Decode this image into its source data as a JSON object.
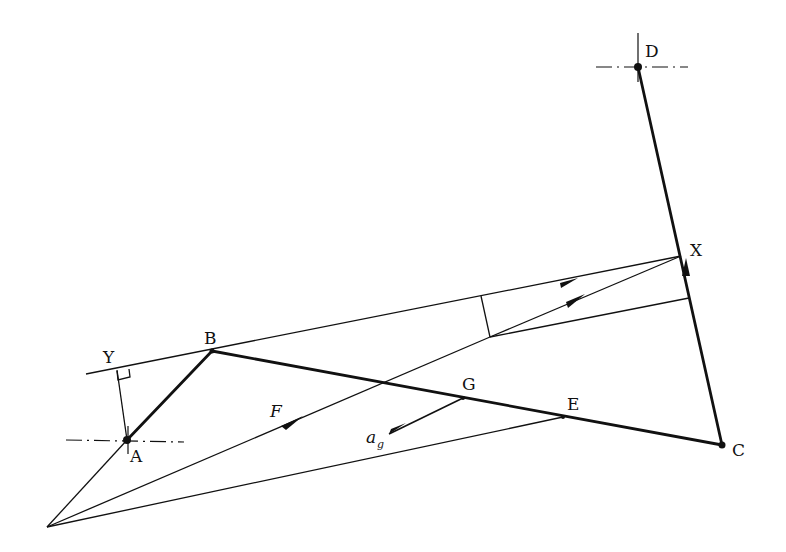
{
  "diagram": {
    "type": "mechanism-acceleration-construction",
    "points": {
      "A": {
        "label": "A",
        "x": 127,
        "y": 440
      },
      "B": {
        "label": "B",
        "x": 212,
        "y": 351
      },
      "C": {
        "label": "C",
        "x": 722,
        "y": 445
      },
      "D": {
        "label": "D",
        "x": 638,
        "y": 67
      },
      "E": {
        "label": "E",
        "x": 563,
        "y": 417
      },
      "G": {
        "label": "G",
        "x": 463,
        "y": 398
      },
      "X": {
        "label": "X",
        "x": 681,
        "y": 256
      },
      "Y": {
        "label": "Y",
        "x": 117,
        "y": 368
      },
      "O": {
        "label": "",
        "x": 47,
        "y": 527
      }
    },
    "labels": {
      "A": "A",
      "B": "B",
      "C": "C",
      "D": "D",
      "E": "E",
      "G": "G",
      "X": "X",
      "Y": "Y",
      "F": "F",
      "ag": "a",
      "ag_sub": "g"
    },
    "links": [
      {
        "name": "link-AB",
        "from": "A",
        "to": "B",
        "weight": "thick"
      },
      {
        "name": "link-BC",
        "from": "B",
        "to": "C",
        "weight": "thick"
      },
      {
        "name": "link-CD",
        "from": "C",
        "to": "D",
        "weight": "thick"
      }
    ],
    "fixed_pivots": [
      "A",
      "D"
    ],
    "vectors": [
      "F",
      "a_g"
    ],
    "colors": {
      "ink": "#111111",
      "background": "#ffffff"
    }
  }
}
